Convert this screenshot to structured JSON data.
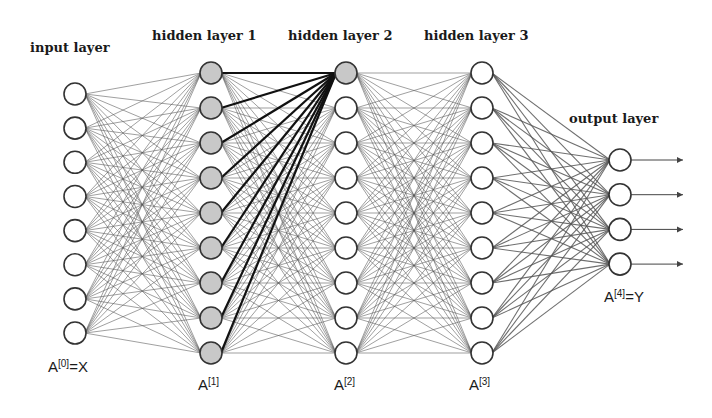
{
  "diagram": {
    "type": "feed-forward neural network",
    "colors": {
      "background": "#ffffff",
      "node_stroke": "#333333",
      "node_fill_default": "#ffffff",
      "node_fill_highlight": "#c8c8c8",
      "edge_default": "#555555",
      "edge_highlight": "#111111",
      "arrow": "#444444"
    },
    "layers": [
      {
        "id": "input",
        "title": "input layer",
        "var": "A",
        "sup": "[0]",
        "suffix": "=X",
        "size": 8,
        "x": 75,
        "y_start": 94,
        "spacing": 34.15,
        "highlight": [],
        "title_x": 30,
        "title_y": 52,
        "var_x": 48,
        "var_y": 372
      },
      {
        "id": "hidden1",
        "title": "hidden layer 1",
        "var": "A",
        "sup": "[1]",
        "suffix": "",
        "size": 9,
        "x": 211,
        "y_start": 73,
        "spacing": 35,
        "highlight": [
          0,
          1,
          2,
          3,
          4,
          5,
          6,
          7,
          8
        ],
        "title_x": 152,
        "title_y": 40,
        "var_x": 198,
        "var_y": 390
      },
      {
        "id": "hidden2",
        "title": "hidden layer 2",
        "var": "A",
        "sup": "[2]",
        "suffix": "",
        "size": 9,
        "x": 346,
        "y_start": 73,
        "spacing": 35,
        "highlight": [
          0
        ],
        "title_x": 288,
        "title_y": 40,
        "var_x": 334,
        "var_y": 390
      },
      {
        "id": "hidden3",
        "title": "hidden layer 3",
        "var": "A",
        "sup": "[3]",
        "suffix": "",
        "size": 9,
        "x": 482,
        "y_start": 73,
        "spacing": 35,
        "highlight": [],
        "title_x": 424,
        "title_y": 40,
        "var_x": 469,
        "var_y": 390
      },
      {
        "id": "output",
        "title": "output layer",
        "var": "A",
        "sup": "[4]",
        "suffix": "=Y",
        "size": 4,
        "x": 620,
        "y_start": 160,
        "spacing": 34.7,
        "highlight": [],
        "title_x": 569,
        "title_y": 123,
        "var_x": 604,
        "var_y": 302
      }
    ],
    "highlighted_edges": {
      "from_layer": 1,
      "to_layer": 2,
      "to_node": 0
    },
    "output_arrows": {
      "length": 58
    },
    "node_radius": 11
  }
}
